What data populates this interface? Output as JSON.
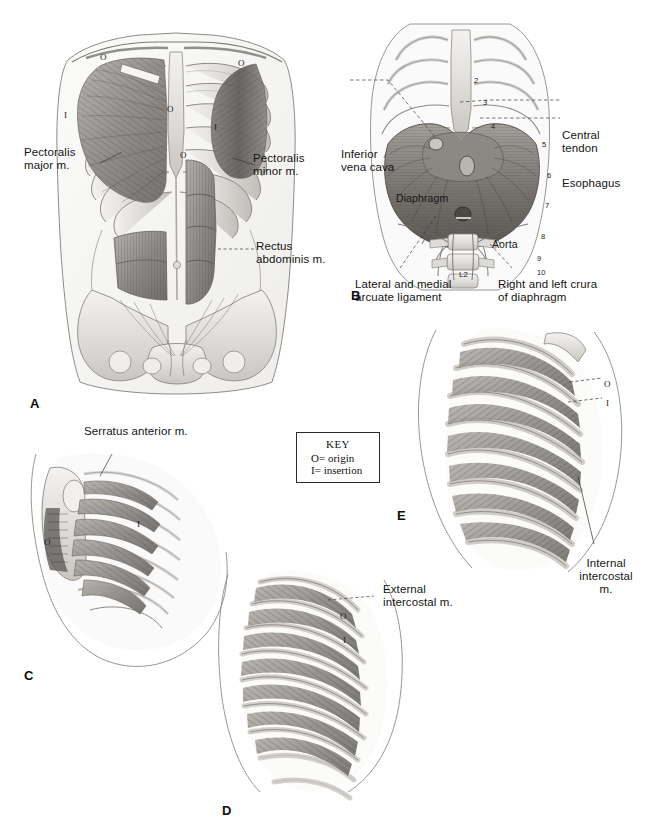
{
  "figure": {
    "background_color": "#ffffff",
    "ink_color": "#141414"
  },
  "key": {
    "title": "KEY",
    "rows": [
      {
        "symbol": "O",
        "equals": "=",
        "meaning": "origin"
      },
      {
        "symbol": "I",
        "equals": "=",
        "meaning": "insertion"
      }
    ]
  },
  "panels": [
    {
      "id": "A",
      "letter": "A",
      "caption": "Anterior thoracic and abdominal wall",
      "labels": [
        {
          "name": "pectoralis-major",
          "text": "Pectoralis\nmajor m."
        },
        {
          "name": "pectoralis-minor",
          "text": "Pectoralis\nminor m."
        },
        {
          "name": "rectus-abdominis",
          "text": "Rectus\nabdominis m."
        }
      ],
      "markers": [
        {
          "symbol": "O"
        },
        {
          "symbol": "O"
        },
        {
          "symbol": "O"
        },
        {
          "symbol": "O"
        },
        {
          "symbol": "I"
        },
        {
          "symbol": "I"
        }
      ]
    },
    {
      "id": "B",
      "letter": "B",
      "caption": "Diaphragm viewed from within the thorax",
      "labels": [
        {
          "name": "inferior-vena-cava",
          "text": "Inferior\nvena cava"
        },
        {
          "name": "central-tendon",
          "text": "Central\ntendon"
        },
        {
          "name": "esophagus",
          "text": "Esophagus"
        },
        {
          "name": "diaphragm",
          "text": "Diaphragm"
        },
        {
          "name": "aorta",
          "text": "Aorta"
        },
        {
          "name": "arcuate-ligament",
          "text": "Lateral and medial\narcuate ligament"
        },
        {
          "name": "crura-of-diaphragm",
          "text": "Right and left crura\nof diaphragm"
        },
        {
          "name": "vertebra-l2",
          "text": "L2"
        }
      ],
      "rib_numbers": [
        "2",
        "3",
        "4",
        "5",
        "6",
        "7",
        "8",
        "9",
        "10"
      ]
    },
    {
      "id": "C",
      "letter": "C",
      "caption": "Serratus anterior, lateral view",
      "labels": [
        {
          "name": "serratus-anterior",
          "text": "Serratus anterior m."
        }
      ],
      "markers": [
        {
          "symbol": "O"
        },
        {
          "symbol": "I"
        }
      ]
    },
    {
      "id": "D",
      "letter": "D",
      "caption": "External intercostal muscles",
      "labels": [
        {
          "name": "external-intercostal",
          "text": "External\nintercostal m."
        }
      ],
      "markers": [
        {
          "symbol": "O"
        },
        {
          "symbol": "I"
        }
      ]
    },
    {
      "id": "E",
      "letter": "E",
      "caption": "Internal intercostal muscles",
      "labels": [
        {
          "name": "internal-intercostal",
          "text": "Internal\nintercostal\nm."
        }
      ],
      "markers": [
        {
          "symbol": "O"
        },
        {
          "symbol": "I"
        }
      ]
    }
  ]
}
